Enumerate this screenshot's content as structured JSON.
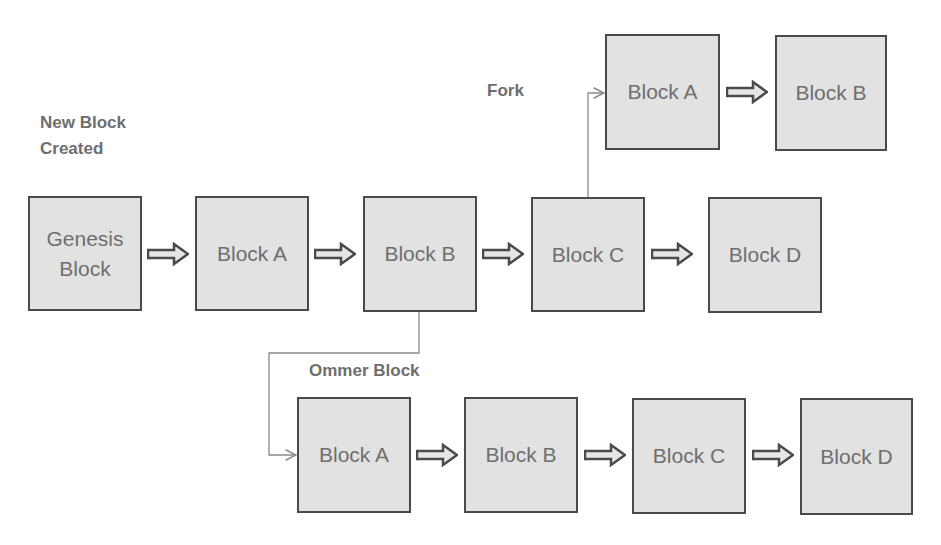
{
  "labels": {
    "new_block": "New Block Created",
    "fork": "Fork",
    "ommer": "Ommer Block"
  },
  "main_chain": [
    {
      "label": "Genesis Block"
    },
    {
      "label": "Block A"
    },
    {
      "label": "Block B"
    },
    {
      "label": "Block C"
    },
    {
      "label": "Block D"
    }
  ],
  "fork_chain": [
    {
      "label": "Block A"
    },
    {
      "label": "Block B"
    }
  ],
  "ommer_chain": [
    {
      "label": "Block A"
    },
    {
      "label": "Block B"
    },
    {
      "label": "Block C"
    },
    {
      "label": "Block D"
    }
  ],
  "colors": {
    "block_fill": "#e2e2e2",
    "block_border": "#4a4a4a",
    "text": "#6f6f6f",
    "connector": "#8a8a8a"
  }
}
